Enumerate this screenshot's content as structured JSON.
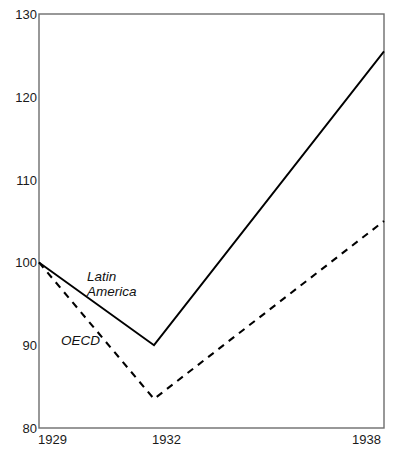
{
  "chart_data": {
    "type": "line",
    "title": "",
    "subtitle": "",
    "xlabel": "",
    "ylabel": "",
    "x": [
      1929,
      1932,
      1938
    ],
    "x_tick_labels": [
      "1929",
      "1932",
      "1938"
    ],
    "y_tick_labels": [
      "80",
      "90",
      "100",
      "110",
      "120",
      "130"
    ],
    "y_ticks": [
      80,
      90,
      100,
      110,
      120,
      130
    ],
    "xlim": [
      1929,
      1938
    ],
    "ylim": [
      80,
      130
    ],
    "grid": false,
    "legend": "inline-annotations",
    "series": [
      {
        "name": "Latin America",
        "label_lines": [
          "Latin",
          "America"
        ],
        "style": "solid",
        "color": "#000000",
        "values": [
          100,
          90,
          125.5
        ]
      },
      {
        "name": "OECD",
        "label_lines": [
          "OECD"
        ],
        "style": "dashed",
        "color": "#000000",
        "values": [
          100,
          83.5,
          105
        ]
      }
    ],
    "annotations": [
      {
        "text": "Latin America",
        "series": "Latin America"
      },
      {
        "text": "OECD",
        "series": "OECD"
      }
    ]
  },
  "axes": {
    "y": {
      "ticks": [
        {
          "label": "130",
          "value": 130
        },
        {
          "label": "120",
          "value": 120
        },
        {
          "label": "110",
          "value": 110
        },
        {
          "label": "100",
          "value": 100
        },
        {
          "label": "90",
          "value": 90
        },
        {
          "label": "80",
          "value": 80
        }
      ]
    },
    "x": {
      "ticks": [
        {
          "label": "1929",
          "value": 1929
        },
        {
          "label": "1932",
          "value": 1932
        },
        {
          "label": "1938",
          "value": 1938
        }
      ]
    }
  },
  "labels": {
    "latin_america_line1": "Latin",
    "latin_america_line2": "America",
    "oecd": "OECD"
  },
  "colors": {
    "frame": "#6d6d6d",
    "series": "#000000",
    "text": "#1a1a1a",
    "background": "#ffffff"
  }
}
